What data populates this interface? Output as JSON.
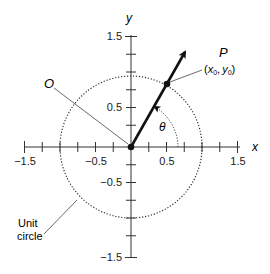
{
  "diagram": {
    "axes": {
      "x_label": "x",
      "y_label": "y",
      "x_ticks": [
        {
          "value": -1.5,
          "label": "−1.5"
        },
        {
          "value": -0.5,
          "label": "−0.5"
        },
        {
          "value": 0.5,
          "label": "0.5"
        },
        {
          "value": 1.5,
          "label": "1.5"
        }
      ],
      "y_ticks": [
        {
          "value": 1.5,
          "label": "1.5"
        },
        {
          "value": 0.5,
          "label": "0.5"
        },
        {
          "value": -0.5,
          "label": "−0.5"
        },
        {
          "value": -1.5,
          "label": "−1.5"
        }
      ],
      "minor_tick_step": 0.25,
      "range": [
        -1.5,
        1.5
      ]
    },
    "labels": {
      "origin": "O",
      "point": "P",
      "point_coords_open": "(",
      "point_x": "x",
      "point_x_sub": "0",
      "point_sep": ",",
      "point_y": "y",
      "point_y_sub": "0",
      "point_coords_close": ")",
      "angle": "θ",
      "unit_circle_line1": "Unit",
      "unit_circle_line2": "circle"
    },
    "geometry": {
      "unit_circle_radius": 1,
      "ray_angle_deg": 60,
      "point_P": [
        0.5,
        0.866
      ]
    }
  }
}
